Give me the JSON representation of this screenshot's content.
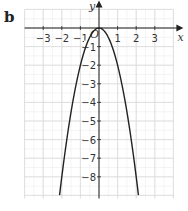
{
  "panel_label": "b",
  "chart_data": {
    "type": "line",
    "title": "",
    "xlabel": "x",
    "ylabel": "y",
    "origin_label": "O",
    "xlim": [
      -4,
      4
    ],
    "ylim": [
      -9,
      1
    ],
    "grid": true,
    "x_ticks": [
      "-3",
      "-2",
      "-1",
      "1",
      "2",
      "3"
    ],
    "y_ticks": [
      "-1",
      "-2",
      "-3",
      "-4",
      "-5",
      "-6",
      "-7",
      "-8"
    ],
    "series": [
      {
        "name": "y = -2x^2",
        "x": [
          -2.12,
          -2,
          -1.5,
          -1,
          -0.5,
          0,
          0.5,
          1,
          1.5,
          2,
          2.12
        ],
        "y": [
          -9,
          -8,
          -4.5,
          -2,
          -0.5,
          0,
          -0.5,
          -2,
          -4.5,
          -8,
          -9
        ]
      }
    ],
    "colors": {
      "curve": "#222222",
      "grid": "#d9d9d9",
      "axis": "#222222"
    }
  }
}
